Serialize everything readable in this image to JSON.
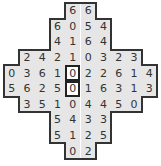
{
  "puzzle": {
    "cols": 10,
    "rows": [
      {
        "start": 4,
        "values": [
          "6",
          "6"
        ]
      },
      {
        "start": 3,
        "values": [
          "6",
          "0",
          "5",
          "4"
        ]
      },
      {
        "start": 3,
        "values": [
          "4",
          "1",
          "6",
          "4"
        ]
      },
      {
        "start": 1,
        "values": [
          "2",
          "4",
          "2",
          "1",
          "0",
          "3",
          "2",
          "3"
        ]
      },
      {
        "start": 0,
        "values": [
          "0",
          "3",
          "6",
          "1",
          "0",
          "2",
          "2",
          "6",
          "1",
          "4"
        ]
      },
      {
        "start": 0,
        "values": [
          "5",
          "6",
          "2",
          "5",
          "0",
          "1",
          "6",
          "3",
          "1",
          "3"
        ]
      },
      {
        "start": 1,
        "values": [
          "3",
          "5",
          "1",
          "0",
          "4",
          "4",
          "5",
          "0"
        ]
      },
      {
        "start": 3,
        "values": [
          "5",
          "4",
          "3",
          "3"
        ]
      },
      {
        "start": 3,
        "values": [
          "5",
          "1",
          "2",
          "5"
        ]
      },
      {
        "start": 4,
        "values": [
          "0",
          "2"
        ]
      }
    ],
    "highlighted": [
      [
        4,
        4
      ],
      [
        5,
        4
      ]
    ]
  },
  "colors": {
    "cell_bg": "#e6e6e6",
    "highlight_bg": "#ffffff",
    "border": "#333333",
    "text": "#333333"
  }
}
